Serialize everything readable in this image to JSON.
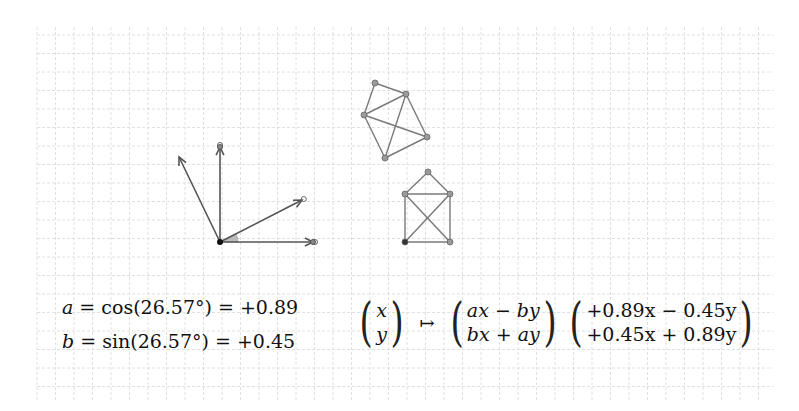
{
  "grid": {
    "x0": 37,
    "y0": 27,
    "x1": 773,
    "y1": 400,
    "spacing": 18.5,
    "color": "#d8d8d8"
  },
  "colors": {
    "vector": "#555555",
    "graph_edge": "#7a7a7a",
    "node_fill": "#9a9a9a",
    "angle_fill": "#bbbbbb"
  },
  "vectors": {
    "origin": [
      220,
      242
    ],
    "items": [
      {
        "name": "e1",
        "to": [
          313,
          242
        ],
        "marker": "double-circle"
      },
      {
        "name": "e2",
        "to": [
          220,
          147
        ],
        "marker": "double-circle"
      },
      {
        "name": "e1-rotated",
        "to": [
          302,
          200
        ],
        "marker": "circle"
      },
      {
        "name": "e2-rotated",
        "to": [
          179,
          157
        ],
        "marker": "none"
      }
    ],
    "angle_deg": 26.57
  },
  "graphs": [
    {
      "name": "original-house",
      "nodes": [
        [
          428,
          172
        ],
        [
          405,
          194
        ],
        [
          450,
          194
        ],
        [
          405,
          242
        ],
        [
          450,
          242
        ]
      ],
      "edges": [
        [
          0,
          1
        ],
        [
          0,
          2
        ],
        [
          1,
          2
        ],
        [
          1,
          3
        ],
        [
          2,
          4
        ],
        [
          3,
          4
        ],
        [
          1,
          4
        ],
        [
          2,
          3
        ]
      ],
      "dark_node": 3
    },
    {
      "name": "rotated-house",
      "nodes": [
        [
          375,
          83
        ],
        [
          364,
          115
        ],
        [
          406,
          94
        ],
        [
          385,
          158
        ],
        [
          427,
          137
        ]
      ],
      "edges": [
        [
          0,
          1
        ],
        [
          0,
          2
        ],
        [
          1,
          2
        ],
        [
          1,
          3
        ],
        [
          2,
          4
        ],
        [
          3,
          4
        ],
        [
          1,
          4
        ],
        [
          2,
          3
        ]
      ],
      "dark_node": -1
    }
  ],
  "formulas": {
    "a_line": {
      "var": "a",
      "eq1": " = cos(26.57°) = ",
      "val": "+0.89"
    },
    "b_line": {
      "var": "b",
      "eq1": " = sin(26.57°) = ",
      "val": "+0.45"
    },
    "map": {
      "input_top": "x",
      "input_bottom": "y",
      "arrow": "↦",
      "symbolic_top": "ax − by",
      "symbolic_bottom": "bx + ay",
      "numeric_top": "+0.89x − 0.45y",
      "numeric_bottom": "+0.45x + 0.89y"
    }
  }
}
